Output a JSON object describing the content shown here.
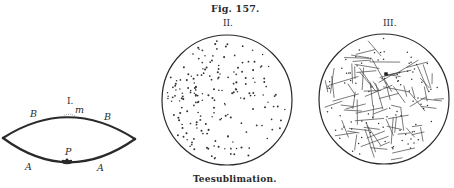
{
  "figure": {
    "number_label": "Fig. 157.",
    "caption": "Teesublimation.",
    "panels": [
      {
        "label": "I.",
        "letters": {
          "B_left": "B",
          "B_right": "B",
          "m": "m",
          "P": "P",
          "A_left": "A",
          "A_right": "A"
        }
      },
      {
        "label": "II."
      },
      {
        "label": "III."
      }
    ]
  },
  "colors": {
    "ink": "#2a2a2a",
    "paper": "#ffffff"
  },
  "geometry": {
    "circle_II": {
      "cx": 227,
      "cy": 100,
      "r": 65
    },
    "circle_III": {
      "cx": 384,
      "cy": 99,
      "r": 65
    },
    "large_crystal_dot": {
      "x": 386,
      "y": 74
    },
    "dot_count_II": 190,
    "dot_count_III": 95,
    "needle_count_III": 85,
    "seed": 157
  }
}
